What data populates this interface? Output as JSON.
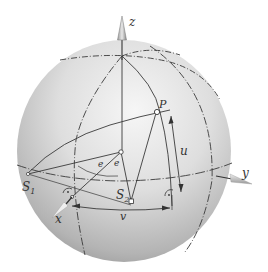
{
  "figure": {
    "type": "sphere-coordinate-diagram",
    "axes": {
      "z": "z",
      "y": "y",
      "x": "x"
    },
    "points": {
      "P": "P",
      "S1": "S",
      "S1_sub": "1",
      "S2": "S",
      "S2_sub": "2"
    },
    "dimensions": {
      "u": "u",
      "v": "v"
    },
    "angle_marks": [
      "e",
      "e"
    ],
    "colors": {
      "sphere_light": "#f4f4f4",
      "sphere_mid": "#c8c8c8",
      "sphere_dark": "#8a8a8a",
      "line": "#3a3a3a"
    }
  }
}
